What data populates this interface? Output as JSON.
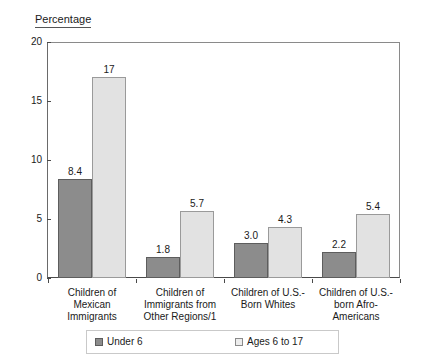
{
  "chart_data": {
    "type": "bar",
    "title": "Percentage",
    "xlabel": "",
    "ylabel": "Percentage",
    "ylim": [
      0,
      20
    ],
    "yticks": [
      0,
      5,
      10,
      15,
      20
    ],
    "grid": false,
    "legend_position": "bottom",
    "categories": [
      "Children of Mexican Immigrants",
      "Children of Immigrants from Other Regions/1",
      "Children of U.S.-Born Whites",
      "Children of U.S.-born Afro-Americans"
    ],
    "category_lines": [
      [
        "Children of Mexican",
        "Immigrants"
      ],
      [
        "Children of",
        "Immigrants from",
        "Other Regions/1"
      ],
      [
        "Children of U.S.-",
        "Born Whites"
      ],
      [
        "Children of U.S.-",
        "born Afro-",
        "Americans"
      ]
    ],
    "series": [
      {
        "name": "Under 6",
        "color": "#8c8c8c",
        "values": [
          8.4,
          1.8,
          3.0,
          2.2
        ],
        "labels": [
          "8.4",
          "1.8",
          "3.0",
          "2.2"
        ]
      },
      {
        "name": "Ages 6 to 17",
        "color": "#e2e2e2",
        "values": [
          17,
          5.7,
          4.3,
          5.4
        ],
        "labels": [
          "17",
          "5.7",
          "4.3",
          "5.4"
        ]
      }
    ]
  },
  "legend": {
    "items": [
      {
        "label": "Under 6",
        "swatch": "dark-gray-swatch-icon"
      },
      {
        "label": "Ages 6 to 17",
        "swatch": "light-gray-swatch-icon"
      }
    ]
  },
  "axis": {
    "y_tick_labels": [
      "20",
      "15",
      "10",
      "5",
      "0"
    ]
  }
}
